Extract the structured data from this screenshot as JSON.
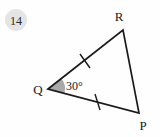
{
  "background_color": "#fefefe",
  "badge": {
    "label": "14",
    "fill_color": "#e4e4e4",
    "text_color": "#2b2b2b",
    "cx": 16,
    "cy": 20,
    "r": 11
  },
  "figure": {
    "type": "triangle",
    "stroke_color": "#1a1a1a",
    "stroke_width": 1.7,
    "fill": "none",
    "vertices": [
      {
        "name": "Q",
        "label": "Q",
        "x": 48,
        "y": 89,
        "label_x": 38,
        "label_y": 94
      },
      {
        "name": "R",
        "label": "R",
        "x": 123,
        "y": 30,
        "label_x": 119,
        "label_y": 21
      },
      {
        "name": "P",
        "label": "P",
        "x": 139,
        "y": 113,
        "label_x": 143,
        "label_y": 130
      }
    ],
    "sides": [
      {
        "name": "QR",
        "from": "Q",
        "to": "R",
        "ticks": 1
      },
      {
        "name": "RP",
        "from": "R",
        "to": "P",
        "ticks": 0
      },
      {
        "name": "QP",
        "from": "Q",
        "to": "P",
        "ticks": 1
      }
    ],
    "tick_marks": [
      {
        "side": "QR",
        "x1": 80,
        "y1": 54,
        "x2": 90,
        "y2": 68,
        "note": "single congruence tick on side QR"
      },
      {
        "side": "QP",
        "x1": 95,
        "y1": 94,
        "x2": 100,
        "y2": 110,
        "note": "single congruence tick on side QP"
      }
    ],
    "angles": [
      {
        "at_vertex": "Q",
        "label": "30°",
        "value": 30,
        "unit": "degrees",
        "wedge_fill": "#a9a9a9",
        "wedge_radius": 17,
        "label_x": 66,
        "label_y": 90
      }
    ]
  }
}
